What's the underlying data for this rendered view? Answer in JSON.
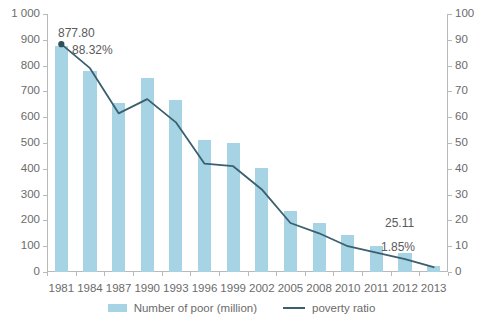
{
  "chart_data": {
    "type": "bar",
    "title": "",
    "subtitle": "",
    "xlabel": "",
    "ylabel": "",
    "y2label": "",
    "grid": false,
    "legend_position": "bottom",
    "categories": [
      "1981",
      "1984",
      "1987",
      "1990",
      "1993",
      "1996",
      "1999",
      "2002",
      "2005",
      "2008",
      "2010",
      "2011",
      "2012",
      "2013"
    ],
    "ylim": [
      0,
      1000
    ],
    "y2lim": [
      0,
      100
    ],
    "ytick_labels": [
      "0",
      "100",
      "200",
      "300",
      "400",
      "500",
      "600",
      "700",
      "800",
      "900",
      "1 000"
    ],
    "ytick_values": [
      0,
      100,
      200,
      300,
      400,
      500,
      600,
      700,
      800,
      900,
      1000
    ],
    "y2tick_labels": [
      "0",
      "10",
      "20",
      "30",
      "40",
      "50",
      "60",
      "70",
      "80",
      "90",
      "100"
    ],
    "y2tick_values": [
      0,
      10,
      20,
      30,
      40,
      50,
      60,
      70,
      80,
      90,
      100
    ],
    "series": [
      {
        "name": "Number of poor (million)",
        "type": "bar",
        "axis": "left",
        "color": "#a6d4e5",
        "values": [
          877.8,
          780,
          655,
          752,
          666,
          510,
          500,
          402,
          235,
          190,
          145,
          100,
          75,
          25.11
        ]
      },
      {
        "name": "poverty ratio",
        "type": "line",
        "axis": "right",
        "color": "#3b5f6e",
        "values": [
          88.32,
          79.0,
          61.5,
          67.0,
          58.0,
          42.0,
          41.0,
          32.0,
          19.0,
          15.0,
          10.0,
          7.5,
          5.0,
          1.85
        ]
      }
    ],
    "annotations": [
      {
        "id": "peak_value",
        "text": "877.80"
      },
      {
        "id": "peak_ratio",
        "text": "88.32%"
      },
      {
        "id": "end_value",
        "text": "25.11"
      },
      {
        "id": "end_ratio",
        "text": "1.85%"
      }
    ]
  },
  "legend": {
    "bar_label": "Number of poor (million)",
    "line_label": "poverty ratio"
  },
  "colors": {
    "bar": "#a6d4e5",
    "line": "#3b5f6e",
    "axis": "#b9b9b9",
    "text": "#6b6b6b",
    "background": "#ffffff"
  }
}
